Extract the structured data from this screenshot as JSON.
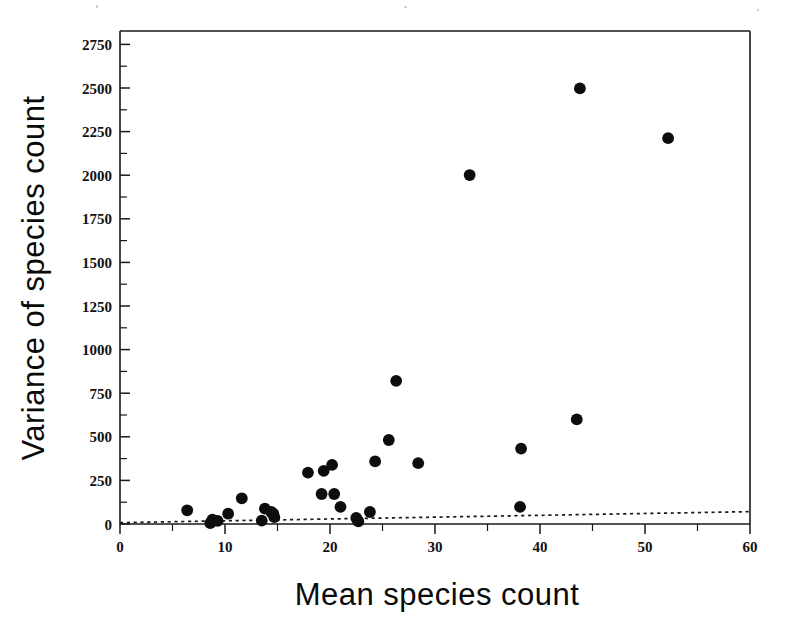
{
  "chart_data": {
    "type": "scatter",
    "title": "",
    "xlabel": "Mean species count",
    "ylabel": "Variance of species count",
    "xlim": [
      0,
      60
    ],
    "ylim": [
      0,
      2875
    ],
    "xticks": [
      0,
      10,
      20,
      30,
      40,
      50,
      60
    ],
    "xtick_labels": [
      "0",
      "10",
      "20",
      "30",
      "40",
      "50",
      "60"
    ],
    "xminor_step": 5,
    "yticks": [
      0,
      250,
      500,
      750,
      1000,
      1250,
      1500,
      1750,
      2000,
      2250,
      2500,
      2750
    ],
    "ytick_labels": [
      "0",
      "250",
      "500",
      "750",
      "1000",
      "1250",
      "1500",
      "1750",
      "2000",
      "2250",
      "2500",
      "2750"
    ],
    "yminor_step": 125,
    "grid": false,
    "legend": "none",
    "marker": "filled-circle",
    "marker_color": "#0d0d0d",
    "marker_size": 7,
    "points": [
      {
        "x": 6.4,
        "y": 80
      },
      {
        "x": 8.6,
        "y": 5
      },
      {
        "x": 8.8,
        "y": 25
      },
      {
        "x": 9.3,
        "y": 18
      },
      {
        "x": 10.3,
        "y": 60
      },
      {
        "x": 11.6,
        "y": 150
      },
      {
        "x": 13.5,
        "y": 20
      },
      {
        "x": 13.8,
        "y": 90
      },
      {
        "x": 14.4,
        "y": 70
      },
      {
        "x": 14.6,
        "y": 60
      },
      {
        "x": 14.7,
        "y": 40
      },
      {
        "x": 17.9,
        "y": 300
      },
      {
        "x": 19.2,
        "y": 175
      },
      {
        "x": 19.4,
        "y": 310
      },
      {
        "x": 20.2,
        "y": 345
      },
      {
        "x": 20.4,
        "y": 175
      },
      {
        "x": 21.0,
        "y": 100
      },
      {
        "x": 22.5,
        "y": 35
      },
      {
        "x": 22.7,
        "y": 15
      },
      {
        "x": 23.8,
        "y": 70
      },
      {
        "x": 24.3,
        "y": 365
      },
      {
        "x": 25.6,
        "y": 490
      },
      {
        "x": 26.3,
        "y": 835
      },
      {
        "x": 28.4,
        "y": 355
      },
      {
        "x": 33.3,
        "y": 2035
      },
      {
        "x": 38.1,
        "y": 100
      },
      {
        "x": 38.2,
        "y": 440
      },
      {
        "x": 43.5,
        "y": 610
      },
      {
        "x": 43.8,
        "y": 2540
      },
      {
        "x": 52.2,
        "y": 2250
      }
    ],
    "reference_line": {
      "style": "dotted",
      "x_start": 0,
      "y_start": 8,
      "x_end": 60,
      "y_end": 72,
      "description": "Poisson expectation (variance = mean)"
    },
    "annotations": []
  },
  "axes": {
    "x_title": "Mean species count",
    "y_title": "Variance of species count"
  }
}
